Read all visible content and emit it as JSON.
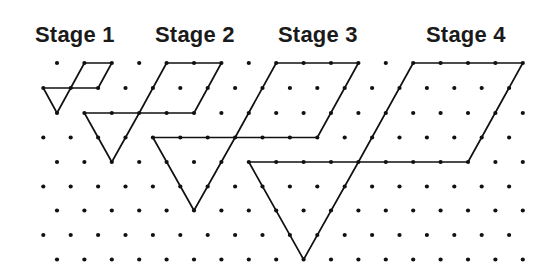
{
  "figure": {
    "labels": [
      {
        "text": "Stage 1",
        "x": 35
      },
      {
        "text": "Stage 2",
        "x": 155
      },
      {
        "text": "Stage 3",
        "x": 278
      },
      {
        "text": "Stage 4",
        "x": 426
      }
    ],
    "colors": {
      "ink": "#111111",
      "background": "#ffffff"
    },
    "grid": {
      "type": "triangular-dot-grid",
      "rows": 9,
      "cols": 18,
      "row_y": [
        63,
        88,
        113,
        137.5,
        162,
        186.5,
        210.5,
        235,
        259.5
      ],
      "odd_row_x0": 57,
      "even_row_x0": 43.3,
      "dx": 27.4,
      "dot_radius": 2.1
    },
    "stages": [
      {
        "name": "Stage 1",
        "scale": 1,
        "parallelogram": [
          [
            1,
            1
          ],
          [
            1,
            2
          ],
          [
            2,
            2
          ],
          [
            2,
            1
          ]
        ],
        "triangle": [
          [
            2,
            0
          ],
          [
            2,
            1
          ],
          [
            3,
            0
          ]
        ]
      },
      {
        "name": "Stage 2",
        "scale": 2,
        "parallelogram": [
          [
            1,
            4
          ],
          [
            1,
            6
          ],
          [
            3,
            5
          ],
          [
            3,
            3
          ]
        ],
        "triangle": [
          [
            3,
            1
          ],
          [
            3,
            3
          ],
          [
            5,
            2
          ]
        ]
      },
      {
        "name": "Stage 3",
        "scale": 3,
        "parallelogram": [
          [
            1,
            8
          ],
          [
            1,
            11
          ],
          [
            4,
            10
          ],
          [
            4,
            7
          ]
        ],
        "triangle": [
          [
            4,
            4
          ],
          [
            4,
            7
          ],
          [
            7,
            5
          ]
        ]
      },
      {
        "name": "Stage 4",
        "scale": 4,
        "parallelogram": [
          [
            1,
            13
          ],
          [
            1,
            17
          ],
          [
            5,
            15
          ],
          [
            5,
            11
          ]
        ],
        "triangle": [
          [
            5,
            7
          ],
          [
            5,
            11
          ],
          [
            9,
            9
          ]
        ]
      }
    ]
  }
}
